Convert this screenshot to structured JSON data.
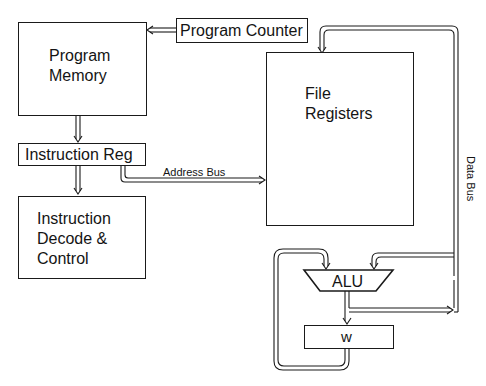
{
  "diagram": {
    "blocks": {
      "program_memory": {
        "line1": "Program",
        "line2": "Memory"
      },
      "program_counter": {
        "label": "Program Counter"
      },
      "file_registers": {
        "line1": "File",
        "line2": "Registers"
      },
      "instruction_reg": {
        "label": "Instruction Reg"
      },
      "instruction_decode": {
        "line1": "Instruction",
        "line2": "Decode &",
        "line3": "Control"
      },
      "alu": {
        "label": "ALU"
      },
      "w_register": {
        "label": "w"
      }
    },
    "buses": {
      "address_bus": {
        "label": "Address Bus"
      },
      "data_bus": {
        "label": "Data Bus"
      }
    },
    "colors": {
      "line": "#1a1a1a",
      "background": "#ffffff"
    }
  }
}
